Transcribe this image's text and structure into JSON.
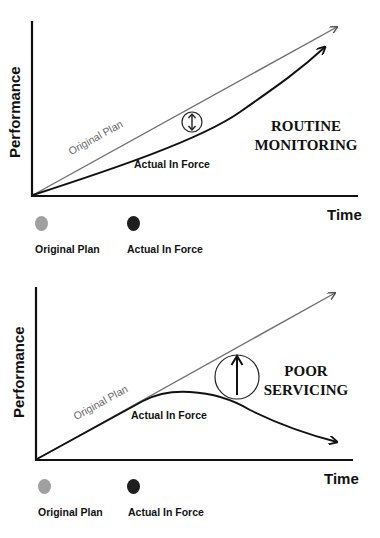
{
  "colors": {
    "original_plan": "#7a7a7a",
    "actual_in_force": "#1a1a1a",
    "legend_plan_dot": "#a0a0a0",
    "legend_actual_dot": "#1e1e1e"
  },
  "diagrams": [
    {
      "title_line1": "ROUTINE",
      "title_line2": "MONITORING",
      "y_axis_label": "Performance",
      "x_axis_label": "Time",
      "plan_curve_label": "Original Plan",
      "actual_curve_label": "Actual In Force",
      "gap_icon": "double-arrow-in-circle",
      "legend": [
        {
          "label": "Original Plan",
          "dot": "gray"
        },
        {
          "label": "Actual In Force",
          "dot": "black"
        }
      ]
    },
    {
      "title_line1": "POOR",
      "title_line2": "SERVICING",
      "y_axis_label": "Performance",
      "x_axis_label": "Time",
      "plan_curve_label": "Original Plan",
      "actual_curve_label": "Actual In Force",
      "gap_icon": "up-arrow-in-circle",
      "legend": [
        {
          "label": "Original Plan",
          "dot": "gray"
        },
        {
          "label": "Actual In Force",
          "dot": "black"
        }
      ]
    }
  ]
}
